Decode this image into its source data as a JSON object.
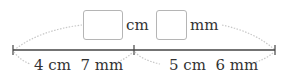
{
  "diagram": {
    "top": {
      "box1_unit": "cm",
      "box2_unit": "mm"
    },
    "segments": [
      {
        "label": "4 cm  7 mm"
      },
      {
        "label": "5 cm  6 mm"
      }
    ],
    "colors": {
      "line": "#444444",
      "arc": "#c8c8c8",
      "box_border": "#b5b5b5"
    }
  }
}
